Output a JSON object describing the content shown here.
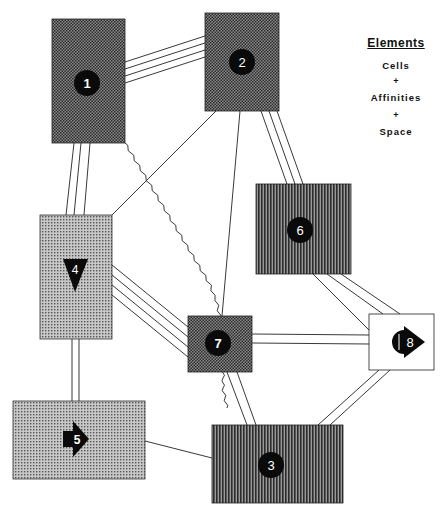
{
  "legend": {
    "title": "Elements",
    "items": [
      "Cells",
      "+",
      "Affinities",
      "+",
      "Space"
    ]
  },
  "cells": [
    {
      "id": "1",
      "label": "1",
      "marker": "circle",
      "pattern": "checker-dark",
      "x": 52,
      "y": 19,
      "w": 73,
      "h": 124
    },
    {
      "id": "2",
      "label": "2",
      "marker": "circle",
      "pattern": "checker-dark",
      "x": 205,
      "y": 13,
      "w": 74,
      "h": 98
    },
    {
      "id": "3",
      "label": "3",
      "marker": "circle",
      "pattern": "vertical-dark",
      "x": 212,
      "y": 425,
      "w": 131,
      "h": 78
    },
    {
      "id": "4",
      "label": "4",
      "marker": "triangle-down",
      "pattern": "grid-light",
      "x": 40,
      "y": 215,
      "w": 72,
      "h": 124
    },
    {
      "id": "5",
      "label": "5",
      "marker": "arrow-right",
      "pattern": "grid-light",
      "x": 13,
      "y": 401,
      "w": 132,
      "h": 78
    },
    {
      "id": "6",
      "label": "6",
      "marker": "circle",
      "pattern": "vertical-dark",
      "x": 256,
      "y": 184,
      "w": 95,
      "h": 90
    },
    {
      "id": "7",
      "label": "7",
      "marker": "circle",
      "pattern": "checker-dark",
      "x": 188,
      "y": 316,
      "w": 64,
      "h": 56
    },
    {
      "id": "8",
      "label": "8",
      "marker": "circle-arrow",
      "pattern": "white",
      "x": 369,
      "y": 314,
      "w": 65,
      "h": 56
    }
  ],
  "affinities": [
    {
      "from": "1",
      "to": "2",
      "strength": 4,
      "type": "solid"
    },
    {
      "from": "1",
      "to": "4",
      "strength": 3,
      "type": "solid"
    },
    {
      "from": "2",
      "to": "6",
      "strength": 3,
      "type": "solid"
    },
    {
      "from": "2",
      "to": "4",
      "strength": 1,
      "type": "solid"
    },
    {
      "from": "2",
      "to": "7",
      "strength": 1,
      "type": "solid"
    },
    {
      "from": "4",
      "to": "7",
      "strength": 4,
      "type": "solid"
    },
    {
      "from": "4",
      "to": "5",
      "strength": 2,
      "type": "solid"
    },
    {
      "from": "5",
      "to": "3",
      "strength": 1,
      "type": "solid"
    },
    {
      "from": "6",
      "to": "8",
      "strength": 3,
      "type": "solid"
    },
    {
      "from": "7",
      "to": "8",
      "strength": 2,
      "type": "solid"
    },
    {
      "from": "7",
      "to": "3",
      "strength": 2,
      "type": "solid"
    },
    {
      "from": "8",
      "to": "3",
      "strength": 2,
      "type": "solid"
    },
    {
      "from": "1",
      "to": "3",
      "strength": 1,
      "type": "wavy"
    }
  ],
  "colors": {
    "ink": "#111111",
    "line": "#222222",
    "background": "#ffffff"
  }
}
